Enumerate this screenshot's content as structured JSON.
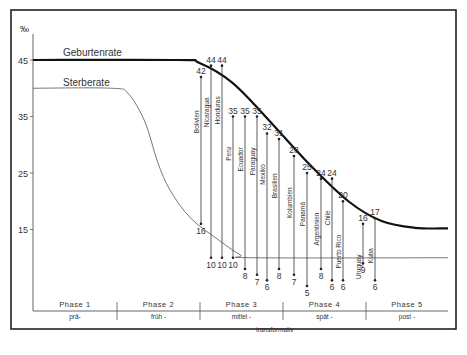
{
  "chart_data": {
    "type": "line",
    "title": "",
    "ylabel": "‰",
    "ylim": [
      8,
      47
    ],
    "yticks": [
      45,
      35,
      25,
      15
    ],
    "series": [
      {
        "name": "Geburtenrate",
        "description": "high plateau at 45, declines through phases 3-4, levels near 15",
        "points": [
          [
            0,
            45
          ],
          [
            0.35,
            45
          ],
          [
            0.4,
            44.5
          ],
          [
            0.48,
            41
          ],
          [
            0.56,
            35
          ],
          [
            0.66,
            27
          ],
          [
            0.76,
            20
          ],
          [
            0.84,
            16.5
          ],
          [
            0.92,
            15.3
          ],
          [
            1.0,
            15.2
          ]
        ]
      },
      {
        "name": "Sterberate",
        "description": "plateau at 40, declines in phase 2-3, levels near 10",
        "points": [
          [
            0,
            40
          ],
          [
            0.19,
            40
          ],
          [
            0.23,
            39
          ],
          [
            0.27,
            34
          ],
          [
            0.3,
            27
          ],
          [
            0.33,
            22
          ],
          [
            0.38,
            17
          ],
          [
            0.45,
            13
          ],
          [
            0.5,
            10.5
          ],
          [
            0.53,
            10
          ],
          [
            1.0,
            10
          ]
        ]
      }
    ],
    "countries": [
      {
        "name": "Bolivien",
        "birth": 42,
        "death": 16
      },
      {
        "name": "Nicaragua",
        "birth": 44,
        "death": 10
      },
      {
        "name": "Honduras",
        "birth": 44,
        "death": 10
      },
      {
        "name": "Peru",
        "birth": 35,
        "death": 10
      },
      {
        "name": "Ecuador",
        "birth": 35,
        "death": 8
      },
      {
        "name": "Paraguay",
        "birth": 35,
        "death": 7
      },
      {
        "name": "Mexiko",
        "birth": 32,
        "death": 6
      },
      {
        "name": "Brasilien",
        "birth": 31,
        "death": 8
      },
      {
        "name": "Kolumbien",
        "birth": 28,
        "death": 7
      },
      {
        "name": "Panamá",
        "birth": 25,
        "death": 5
      },
      {
        "name": "Argentinien",
        "birth": 24,
        "death": 8
      },
      {
        "name": "Chile",
        "birth": 24,
        "death": 6
      },
      {
        "name": "Puerto Rico",
        "birth": 20,
        "death": 6
      },
      {
        "name": "Uruguay",
        "birth": 16,
        "death": 9
      },
      {
        "name": "Kuba",
        "birth": 17,
        "death": 6
      }
    ],
    "phases": [
      {
        "label": "Phase  1",
        "sub": "prä-"
      },
      {
        "label": "Phase  2",
        "sub": "früh -"
      },
      {
        "label": "Phase  3",
        "sub": "mittel -"
      },
      {
        "label": "Phase  4",
        "sub": "spät -"
      },
      {
        "label": "Phase  5",
        "sub": "post -"
      }
    ],
    "phase_caption": "transformativ",
    "grid": false,
    "legend": "inline labels above curves"
  }
}
